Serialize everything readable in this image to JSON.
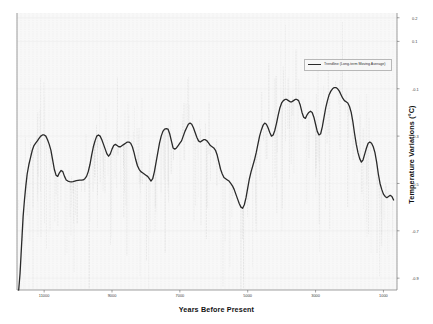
{
  "chart_data": {
    "type": "line",
    "title": "",
    "xlabel": "Years Before Present",
    "ylabel": "Temperature Variations (°C)",
    "xlim": [
      11800,
      600
    ],
    "ylim": [
      -0.95,
      0.22
    ],
    "x_inverted": true,
    "grid": true,
    "grid_style": "dotted vertical",
    "legend_position": "upper right",
    "xticks": [
      11000,
      9000,
      7000,
      5000,
      3000,
      1000
    ],
    "xticklabels": [
      "11000",
      "9000",
      "7000",
      "5000",
      "3000",
      "1000"
    ],
    "yticks": [
      0.2,
      0.1,
      -0.1,
      -0.3,
      -0.5,
      -0.7,
      -0.9
    ],
    "yticklabels": [
      "0.2",
      "0.1",
      "-0.1",
      "-0.3",
      "-0.5",
      "-0.7",
      "-0.9"
    ],
    "series": [
      {
        "name": "Trendline (Long-term Moving Average)",
        "color": "#2a2a2a",
        "linewidth": 1.3,
        "x": [
          11750,
          11710,
          11680,
          11650,
          11620,
          11580,
          11540,
          11500,
          11450,
          11400,
          11350,
          11300,
          11250,
          11200,
          11150,
          11100,
          11050,
          11000,
          10950,
          10900,
          10850,
          10800,
          10750,
          10700,
          10650,
          10600,
          10550,
          10500,
          10450,
          10400,
          10350,
          10300,
          10250,
          10200,
          10150,
          10100,
          10050,
          10000,
          9950,
          9900,
          9850,
          9800,
          9750,
          9700,
          9650,
          9600,
          9550,
          9500,
          9450,
          9400,
          9350,
          9300,
          9250,
          9200,
          9150,
          9100,
          9050,
          9000,
          8950,
          8900,
          8850,
          8800,
          8750,
          8700,
          8650,
          8600,
          8550,
          8500,
          8450,
          8400,
          8350,
          8300,
          8250,
          8200,
          8150,
          8100,
          8050,
          8000,
          7950,
          7900,
          7850,
          7800,
          7750,
          7700,
          7650,
          7600,
          7550,
          7500,
          7450,
          7400,
          7350,
          7300,
          7250,
          7200,
          7150,
          7100,
          7050,
          7000,
          6950,
          6900,
          6850,
          6800,
          6750,
          6700,
          6650,
          6600,
          6550,
          6500,
          6450,
          6400,
          6350,
          6300,
          6250,
          6200,
          6150,
          6100,
          6050,
          6000,
          5950,
          5900,
          5850,
          5800,
          5750,
          5700,
          5650,
          5600,
          5550,
          5500,
          5450,
          5400,
          5350,
          5300,
          5250,
          5200,
          5150,
          5100,
          5050,
          5000,
          4950,
          4900,
          4850,
          4800,
          4750,
          4700,
          4650,
          4600,
          4550,
          4500,
          4450,
          4400,
          4350,
          4300,
          4250,
          4200,
          4150,
          4100,
          4050,
          4000,
          3950,
          3900,
          3850,
          3800,
          3750,
          3700,
          3650,
          3600,
          3550,
          3500,
          3450,
          3400,
          3350,
          3300,
          3250,
          3200,
          3150,
          3100,
          3050,
          3000,
          2950,
          2900,
          2850,
          2800,
          2750,
          2700,
          2650,
          2600,
          2550,
          2500,
          2450,
          2400,
          2350,
          2300,
          2250,
          2200,
          2150,
          2100,
          2050,
          2000,
          1950,
          1900,
          1850,
          1800,
          1750,
          1700,
          1650,
          1600,
          1550,
          1500,
          1450,
          1400,
          1350,
          1300,
          1250,
          1200,
          1150,
          1100,
          1050,
          1000,
          950,
          900,
          850,
          800,
          750,
          700
        ],
        "values": [
          -0.95,
          -0.88,
          -0.8,
          -0.72,
          -0.64,
          -0.57,
          -0.51,
          -0.46,
          -0.42,
          -0.39,
          -0.36,
          -0.34,
          -0.33,
          -0.32,
          -0.31,
          -0.3,
          -0.295,
          -0.295,
          -0.3,
          -0.315,
          -0.335,
          -0.36,
          -0.4,
          -0.44,
          -0.465,
          -0.47,
          -0.455,
          -0.445,
          -0.45,
          -0.47,
          -0.485,
          -0.49,
          -0.492,
          -0.493,
          -0.492,
          -0.49,
          -0.488,
          -0.487,
          -0.486,
          -0.486,
          -0.485,
          -0.48,
          -0.47,
          -0.45,
          -0.42,
          -0.38,
          -0.345,
          -0.32,
          -0.3,
          -0.295,
          -0.3,
          -0.315,
          -0.335,
          -0.355,
          -0.375,
          -0.385,
          -0.375,
          -0.355,
          -0.34,
          -0.335,
          -0.34,
          -0.345,
          -0.345,
          -0.34,
          -0.335,
          -0.33,
          -0.325,
          -0.325,
          -0.33,
          -0.345,
          -0.37,
          -0.4,
          -0.425,
          -0.44,
          -0.45,
          -0.455,
          -0.46,
          -0.465,
          -0.47,
          -0.48,
          -0.49,
          -0.48,
          -0.45,
          -0.41,
          -0.37,
          -0.33,
          -0.3,
          -0.28,
          -0.27,
          -0.268,
          -0.27,
          -0.29,
          -0.32,
          -0.35,
          -0.355,
          -0.35,
          -0.34,
          -0.33,
          -0.32,
          -0.3,
          -0.28,
          -0.265,
          -0.25,
          -0.245,
          -0.25,
          -0.265,
          -0.285,
          -0.305,
          -0.32,
          -0.325,
          -0.32,
          -0.315,
          -0.315,
          -0.32,
          -0.33,
          -0.34,
          -0.345,
          -0.35,
          -0.36,
          -0.38,
          -0.41,
          -0.44,
          -0.46,
          -0.475,
          -0.48,
          -0.485,
          -0.49,
          -0.5,
          -0.51,
          -0.525,
          -0.545,
          -0.565,
          -0.585,
          -0.6,
          -0.605,
          -0.59,
          -0.56,
          -0.52,
          -0.48,
          -0.45,
          -0.425,
          -0.4,
          -0.37,
          -0.335,
          -0.3,
          -0.275,
          -0.255,
          -0.245,
          -0.25,
          -0.265,
          -0.285,
          -0.3,
          -0.295,
          -0.275,
          -0.245,
          -0.21,
          -0.18,
          -0.16,
          -0.15,
          -0.145,
          -0.145,
          -0.15,
          -0.155,
          -0.155,
          -0.15,
          -0.145,
          -0.145,
          -0.15,
          -0.17,
          -0.2,
          -0.22,
          -0.225,
          -0.21,
          -0.2,
          -0.195,
          -0.2,
          -0.22,
          -0.25,
          -0.28,
          -0.295,
          -0.29,
          -0.26,
          -0.22,
          -0.18,
          -0.15,
          -0.125,
          -0.11,
          -0.1,
          -0.095,
          -0.095,
          -0.1,
          -0.11,
          -0.125,
          -0.14,
          -0.15,
          -0.155,
          -0.16,
          -0.175,
          -0.2,
          -0.24,
          -0.29,
          -0.335,
          -0.37,
          -0.395,
          -0.41,
          -0.4,
          -0.375,
          -0.35,
          -0.33,
          -0.325,
          -0.33,
          -0.345,
          -0.37,
          -0.41,
          -0.46,
          -0.5,
          -0.525,
          -0.545,
          -0.555,
          -0.56,
          -0.555,
          -0.55,
          -0.555,
          -0.57
        ]
      }
    ],
    "noise_overlay": {
      "description": "light grey dotted high-frequency proxy data behind trendline",
      "color": "#cccccc"
    }
  },
  "legend": {
    "entries": [
      {
        "label": "Trendline (Long-term Moving Average)",
        "color": "#2a2a2a"
      }
    ]
  }
}
